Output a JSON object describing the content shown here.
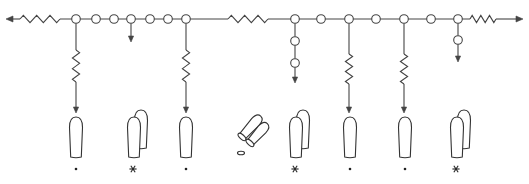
{
  "diagram": {
    "type": "schematic-network",
    "main_line": {
      "y": 19,
      "x_start": 6,
      "x_end": 523,
      "left_arrow": true,
      "right_arrow": true
    },
    "resistors_on_main": [
      {
        "id": "r-left",
        "x1": 20,
        "x2": 60
      },
      {
        "id": "r-middle",
        "x1": 228,
        "x2": 268
      },
      {
        "id": "r-right",
        "x1": 470,
        "x2": 496
      }
    ],
    "main_nodes": [
      76,
      96,
      114,
      131,
      150,
      168,
      186,
      295,
      321,
      349,
      376,
      404,
      431,
      458
    ],
    "branches": [
      {
        "id": "branch-1",
        "x": 76,
        "resistor": [
          50,
          82
        ],
        "extra_nodes": [],
        "arrow_end": 113
      },
      {
        "id": "branch-2",
        "x": 131,
        "resistor": null,
        "extra_nodes": [],
        "arrow_end": 42
      },
      {
        "id": "branch-3",
        "x": 186,
        "resistor": [
          50,
          82
        ],
        "extra_nodes": [],
        "arrow_end": 113
      },
      {
        "id": "branch-4",
        "x": 295,
        "resistor": null,
        "extra_nodes": [
          41,
          63
        ],
        "arrow_end": 83
      },
      {
        "id": "branch-5",
        "x": 349,
        "resistor": [
          54,
          84
        ],
        "extra_nodes": [],
        "arrow_end": 113
      },
      {
        "id": "branch-6",
        "x": 404,
        "resistor": [
          54,
          84
        ],
        "extra_nodes": [],
        "arrow_end": 113
      },
      {
        "id": "branch-7",
        "x": 458,
        "resistor": null,
        "extra_nodes": [
          40
        ],
        "arrow_end": 62
      }
    ],
    "items": [
      {
        "id": "item-1",
        "kind": "single",
        "x": 76,
        "marker": "dot"
      },
      {
        "id": "item-2",
        "kind": "double",
        "x": 134,
        "marker": "star"
      },
      {
        "id": "item-3",
        "kind": "single",
        "x": 186,
        "marker": "dot"
      },
      {
        "id": "item-4",
        "kind": "tilted-pair",
        "x": 250,
        "marker": "small-oval"
      },
      {
        "id": "item-5",
        "kind": "double",
        "x": 296,
        "marker": "star"
      },
      {
        "id": "item-6",
        "kind": "single",
        "x": 350,
        "marker": "dot"
      },
      {
        "id": "item-7",
        "kind": "single",
        "x": 405,
        "marker": "dot"
      },
      {
        "id": "item-8",
        "kind": "double",
        "x": 457,
        "marker": "star"
      }
    ],
    "marker_y": 169,
    "colors": {
      "line": "#444444",
      "fill": "#ffffff",
      "marker": "#222222"
    }
  }
}
